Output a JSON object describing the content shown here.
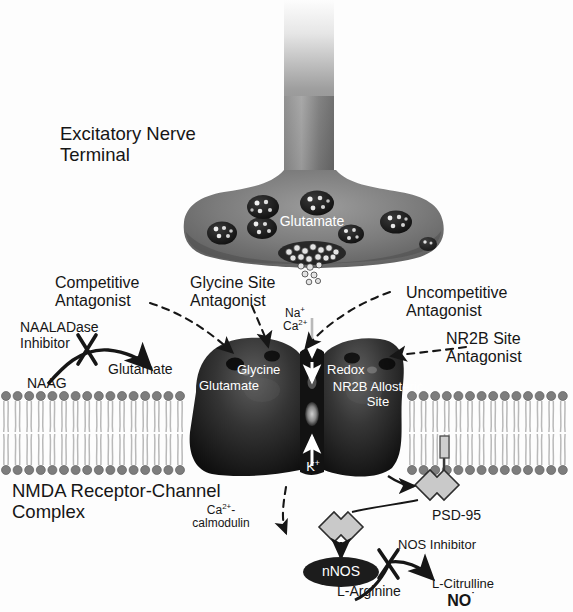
{
  "figure": {
    "background_color": "#fdfdfd"
  },
  "colors": {
    "terminal_gray": "#7b7b7b",
    "terminal_gray_dark": "#5c5c5c",
    "axon_top": "#f2f2f2",
    "receptor_dark": "#1d1d1d",
    "receptor_mid": "#4a4a4a",
    "membrane_head": "#7d7d7d",
    "membrane_tail": "#b9b9b9",
    "psd95_fill": "#c9c9c9",
    "nnos_fill": "#1c1c1c",
    "ink": "#161616",
    "white_text": "#ffffff"
  },
  "presynaptic": {
    "terminal_label_line1": "Excitatory Nerve",
    "terminal_label_line2": "Terminal",
    "neurotransmitter_label": "Glutamate",
    "vesicle_count": 7
  },
  "antagonist_callouts": [
    {
      "name": "competitive-antagonist",
      "line1": "Competitive",
      "line2": "Antagonist"
    },
    {
      "name": "glycine-site-antagonist",
      "line1": "Glycine Site",
      "line2": "Antagonist"
    },
    {
      "name": "uncompetitive-antagonist",
      "line1": "Uncompetitive",
      "line2": "Antagonist"
    },
    {
      "name": "nr2b-site-antagonist",
      "line1": "NR2B Site",
      "line2": "Antagonist"
    }
  ],
  "naaladase_pathway": {
    "inhibitor_line1": "NAALADase",
    "inhibitor_line2": "Inhibitor",
    "substrate": "NAAG",
    "product": "Glutamate",
    "blocked": true
  },
  "receptor": {
    "complex_label_line1": "NMDA Receptor-Channel",
    "complex_label_line2": "Complex",
    "site_glutamate": "Glutamate",
    "site_glycine": "Glycine",
    "site_redox": "Redox",
    "site_nr2b_line1": "NR2B Allosteric",
    "site_nr2b_line2": "Site",
    "ion_influx_na": "Na",
    "ion_influx_na_charge": "+",
    "ion_influx_ca": "Ca",
    "ion_influx_ca_charge": "2+",
    "ion_efflux_k": "K",
    "ion_efflux_k_charge": "+"
  },
  "downstream": {
    "scaffold_protein": "PSD-95",
    "activator_line1": "Ca",
    "activator_charge": "2+",
    "activator_line1_suffix": "-",
    "activator_line2": "calmodulin",
    "enzyme": "nNOS",
    "inhibitor": "NOS Inhibitor",
    "substrate": "L-Arginine",
    "product_line1": "L-Citrulline",
    "product_line2": "NO",
    "product_radical_dot": "˙"
  }
}
